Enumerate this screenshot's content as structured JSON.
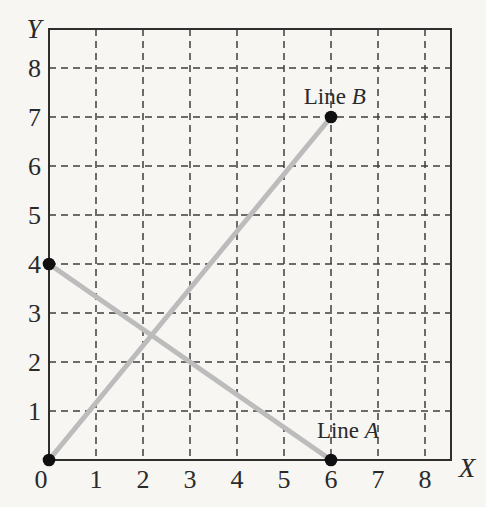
{
  "page": {
    "background_color": "#f7f6f2"
  },
  "chart_data": {
    "type": "line",
    "title": "",
    "xlabel": "X",
    "ylabel": "Y",
    "x_ticks": [
      0,
      1,
      2,
      3,
      4,
      5,
      6,
      7,
      8
    ],
    "y_ticks": [
      1,
      2,
      3,
      4,
      5,
      6,
      7,
      8
    ],
    "xlim": [
      0,
      8.55
    ],
    "ylim": [
      0,
      8.8
    ],
    "grid": "dashed",
    "legend": "none",
    "series": [
      {
        "name": "Line B",
        "points": [
          [
            0,
            0
          ],
          [
            6,
            7
          ]
        ],
        "color": "#bcbcbc"
      },
      {
        "name": "Line A",
        "points": [
          [
            0,
            4
          ],
          [
            6,
            0
          ]
        ],
        "color": "#bcbcbc"
      }
    ],
    "markers": {
      "points": [
        [
          0,
          0
        ],
        [
          0,
          4
        ],
        [
          6,
          7
        ],
        [
          6,
          0
        ]
      ],
      "color": "#101010",
      "radius": 6.3
    },
    "annotations": [
      {
        "text": "Line B",
        "x": 6.08,
        "y": 7.43
      },
      {
        "text": "Line A",
        "x": 6.36,
        "y": 0.61
      }
    ],
    "colors": {
      "grid": "#3f3f3f",
      "frame": "#2e2e2e",
      "tick_text": "#2a2a2a",
      "line": "#bcbcbc",
      "marker": "#101010"
    }
  }
}
